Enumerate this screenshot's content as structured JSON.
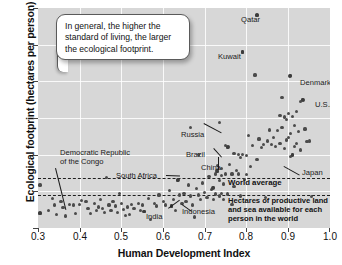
{
  "chart_data": {
    "type": "scatter",
    "title": "",
    "xlabel": "Human Development Index",
    "ylabel": "Ecological footprint (hectares per person)",
    "xlim": [
      0.3,
      1.0
    ],
    "ylim": [
      0,
      12
    ],
    "xticks": [
      "0.3",
      "0.4",
      "0.5",
      "0.6",
      "0.7",
      "0.8",
      "0.9",
      "1.0"
    ],
    "yticks": [
      "0",
      "2",
      "4",
      "6",
      "8",
      "10",
      "12"
    ],
    "grid": true,
    "legend_position": "none",
    "plot_background": "#d7d7d7",
    "point_color": "#4b4b4b",
    "reference_lines": [
      {
        "name": "world-average",
        "y": 2.75,
        "style": "dashed",
        "label": "World average"
      },
      {
        "name": "biocapacity",
        "y": 1.8,
        "style": "dashed",
        "label": "Hectares of productive land and sea available for each person in the world"
      }
    ],
    "annotation_box": "In general, the higher the standard of living, the larger the ecological footprint.",
    "labeled_points": [
      {
        "name": "Qatar",
        "x": 0.825,
        "y": 11.6
      },
      {
        "name": "Kuwait",
        "x": 0.79,
        "y": 9.6
      },
      {
        "name": "Denmark",
        "x": 0.905,
        "y": 8.3
      },
      {
        "name": "U.S.A.",
        "x": 0.935,
        "y": 7.0
      },
      {
        "name": "Russia",
        "x": 0.755,
        "y": 4.4
      },
      {
        "name": "Brazil",
        "x": 0.73,
        "y": 3.1
      },
      {
        "name": "China",
        "x": 0.72,
        "y": 2.2
      },
      {
        "name": "Japan",
        "x": 0.91,
        "y": 4.0
      },
      {
        "name": "South Africa",
        "x": 0.635,
        "y": 2.6
      },
      {
        "name": "Indonesia",
        "x": 0.62,
        "y": 1.2
      },
      {
        "name": "India",
        "x": 0.555,
        "y": 0.9
      },
      {
        "name": "Democratic Republic of the Congo",
        "x": 0.305,
        "y": 0.8
      }
    ],
    "labels_text": {
      "qatar": "Qatar",
      "kuwait": "Kuwait",
      "denmark": "Denmark",
      "usa": "U.S.A.",
      "russia": "Russia",
      "brazil": "Brazil",
      "china": "China",
      "japan": "Japan",
      "south_africa": "South Africa",
      "indonesia": "Indonesia",
      "india": "India",
      "drc_line1": "Democratic Republic",
      "drc_line2": "of the Congo",
      "world_average": "World average",
      "capacity": "Hectares of productive land and sea available for each person in the world"
    },
    "points": [
      [
        0.305,
        2.35
      ],
      [
        0.305,
        0.8
      ],
      [
        0.325,
        0.95
      ],
      [
        0.335,
        1.6
      ],
      [
        0.34,
        1.25
      ],
      [
        0.345,
        0.75
      ],
      [
        0.355,
        1.45
      ],
      [
        0.36,
        1.1
      ],
      [
        0.365,
        0.65
      ],
      [
        0.375,
        1.3
      ],
      [
        0.385,
        1.25
      ],
      [
        0.39,
        0.8
      ],
      [
        0.4,
        1.3
      ],
      [
        0.405,
        1.5
      ],
      [
        0.415,
        1.45
      ],
      [
        0.42,
        1.05
      ],
      [
        0.425,
        0.8
      ],
      [
        0.435,
        1.35
      ],
      [
        0.44,
        0.95
      ],
      [
        0.445,
        1.15
      ],
      [
        0.45,
        1.55
      ],
      [
        0.455,
        1.05
      ],
      [
        0.46,
        0.85
      ],
      [
        0.465,
        2.75
      ],
      [
        0.47,
        1.25
      ],
      [
        0.475,
        0.95
      ],
      [
        0.48,
        1.45
      ],
      [
        0.485,
        1.2
      ],
      [
        0.49,
        0.85
      ],
      [
        0.495,
        1.9
      ],
      [
        0.5,
        1.35
      ],
      [
        0.505,
        1.0
      ],
      [
        0.51,
        0.7
      ],
      [
        0.515,
        1.15
      ],
      [
        0.52,
        0.75
      ],
      [
        0.525,
        1.3
      ],
      [
        0.53,
        1.05
      ],
      [
        0.54,
        1.35
      ],
      [
        0.545,
        0.95
      ],
      [
        0.55,
        1.25
      ],
      [
        0.555,
        0.9
      ],
      [
        0.565,
        1.6
      ],
      [
        0.57,
        0.45
      ],
      [
        0.58,
        1.35
      ],
      [
        0.585,
        1.2
      ],
      [
        0.59,
        1.8
      ],
      [
        0.6,
        1.45
      ],
      [
        0.605,
        1.25
      ],
      [
        0.615,
        2.05
      ],
      [
        0.62,
        1.2
      ],
      [
        0.625,
        1.55
      ],
      [
        0.63,
        0.95
      ],
      [
        0.635,
        2.6
      ],
      [
        0.64,
        1.8
      ],
      [
        0.645,
        1.35
      ],
      [
        0.65,
        1.9
      ],
      [
        0.655,
        1.45
      ],
      [
        0.66,
        2.35
      ],
      [
        0.665,
        1.75
      ],
      [
        0.665,
        5.5
      ],
      [
        0.67,
        1.25
      ],
      [
        0.675,
        0.6
      ],
      [
        0.68,
        2.15
      ],
      [
        0.685,
        4.0
      ],
      [
        0.685,
        1.8
      ],
      [
        0.69,
        1.55
      ],
      [
        0.695,
        2.45
      ],
      [
        0.7,
        1.95
      ],
      [
        0.705,
        1.65
      ],
      [
        0.71,
        2.8
      ],
      [
        0.715,
        2.1
      ],
      [
        0.72,
        2.2
      ],
      [
        0.72,
        1.55
      ],
      [
        0.725,
        2.95
      ],
      [
        0.725,
        1.85
      ],
      [
        0.73,
        3.4
      ],
      [
        0.73,
        3.1
      ],
      [
        0.735,
        5.75
      ],
      [
        0.735,
        2.6
      ],
      [
        0.735,
        1.75
      ],
      [
        0.74,
        3.25
      ],
      [
        0.74,
        2.85
      ],
      [
        0.74,
        1.9
      ],
      [
        0.745,
        2.4
      ],
      [
        0.745,
        1.55
      ],
      [
        0.75,
        4.5
      ],
      [
        0.75,
        2.95
      ],
      [
        0.755,
        4.4
      ],
      [
        0.755,
        1.85
      ],
      [
        0.76,
        3.45
      ],
      [
        0.765,
        2.95
      ],
      [
        0.765,
        1.3
      ],
      [
        0.77,
        4.05
      ],
      [
        0.77,
        2.25
      ],
      [
        0.775,
        3.15
      ],
      [
        0.78,
        4.0
      ],
      [
        0.78,
        2.95
      ],
      [
        0.785,
        3.85
      ],
      [
        0.785,
        1.75
      ],
      [
        0.79,
        9.6
      ],
      [
        0.79,
        4.0
      ],
      [
        0.795,
        2.65
      ],
      [
        0.8,
        3.95
      ],
      [
        0.8,
        2.9
      ],
      [
        0.805,
        5.05
      ],
      [
        0.81,
        3.35
      ],
      [
        0.815,
        4.5
      ],
      [
        0.82,
        8.35
      ],
      [
        0.825,
        11.6
      ],
      [
        0.825,
        3.75
      ],
      [
        0.83,
        4.85
      ],
      [
        0.835,
        4.4
      ],
      [
        0.84,
        4.55
      ],
      [
        0.845,
        1.65
      ],
      [
        0.85,
        4.75
      ],
      [
        0.855,
        5.35
      ],
      [
        0.86,
        4.55
      ],
      [
        0.865,
        4.95
      ],
      [
        0.87,
        4.45
      ],
      [
        0.875,
        5.3
      ],
      [
        0.88,
        6.15
      ],
      [
        0.88,
        4.6
      ],
      [
        0.885,
        7.1
      ],
      [
        0.885,
        5.5
      ],
      [
        0.89,
        6.05
      ],
      [
        0.89,
        4.35
      ],
      [
        0.895,
        5.9
      ],
      [
        0.895,
        4.8
      ],
      [
        0.9,
        6.25
      ],
      [
        0.9,
        4.95
      ],
      [
        0.905,
        8.3
      ],
      [
        0.905,
        5.15
      ],
      [
        0.905,
        3.9
      ],
      [
        0.91,
        6.1
      ],
      [
        0.91,
        4.0
      ],
      [
        0.915,
        5.6
      ],
      [
        0.915,
        4.45
      ],
      [
        0.92,
        6.35
      ],
      [
        0.92,
        4.6
      ],
      [
        0.925,
        5.25
      ],
      [
        0.93,
        6.9
      ],
      [
        0.93,
        4.25
      ],
      [
        0.935,
        7.0
      ],
      [
        0.94,
        5.4
      ],
      [
        0.945,
        4.7
      ],
      [
        0.95,
        4.75
      ],
      [
        0.955,
        1.7
      ]
    ]
  }
}
